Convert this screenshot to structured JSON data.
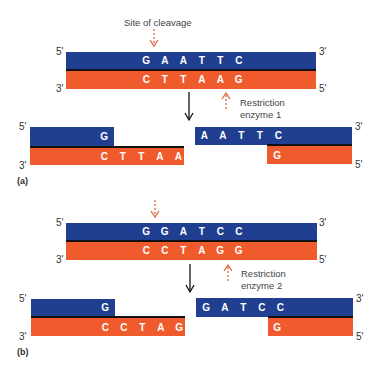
{
  "colors": {
    "top_strand": "#213f90",
    "bottom_strand": "#ef5b2d",
    "cleavage_arrow": "#e0673e"
  },
  "panels": [
    {
      "label": "(a)",
      "cleavage_label": "Site of cleavage",
      "enzyme_label_line1": "Restriction",
      "enzyme_label_line2": "enzyme 1",
      "intact": {
        "top_5": "5'",
        "top_3": "3'",
        "bottom_3": "3'",
        "bottom_5": "5'",
        "top_bases": [
          "G",
          "A",
          "A",
          "T",
          "T",
          "C"
        ],
        "bottom_bases": [
          "C",
          "T",
          "T",
          "A",
          "A",
          "G"
        ]
      },
      "left_fragment": {
        "top_5": "5'",
        "bottom_3": "3'",
        "top_bases": [
          "G"
        ],
        "bottom_bases": [
          "C",
          "T",
          "T",
          "A",
          "A"
        ]
      },
      "right_fragment": {
        "top_3": "3'",
        "bottom_5": "5'",
        "top_bases": [
          "A",
          "A",
          "T",
          "T",
          "C"
        ],
        "bottom_bases": [
          "G"
        ]
      }
    },
    {
      "label": "(b)",
      "enzyme_label_line1": "Restriction",
      "enzyme_label_line2": "enzyme 2",
      "intact": {
        "top_5": "5'",
        "top_3": "3'",
        "bottom_3": "3'",
        "bottom_5": "5'",
        "top_bases": [
          "G",
          "G",
          "A",
          "T",
          "C",
          "C"
        ],
        "bottom_bases": [
          "C",
          "C",
          "T",
          "A",
          "G",
          "G"
        ]
      },
      "left_fragment": {
        "top_5": "5'",
        "bottom_3": "3'",
        "top_bases": [
          "G"
        ],
        "bottom_bases": [
          "C",
          "C",
          "T",
          "A",
          "G"
        ]
      },
      "right_fragment": {
        "top_3": "3'",
        "bottom_5": "5'",
        "top_bases": [
          "G",
          "A",
          "T",
          "C",
          "C"
        ],
        "bottom_bases": [
          "G"
        ]
      }
    }
  ]
}
